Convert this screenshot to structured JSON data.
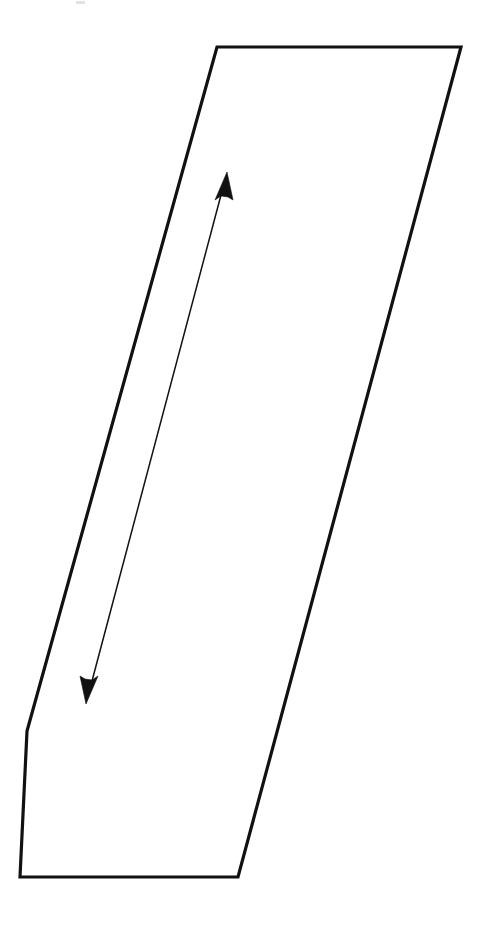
{
  "document": {
    "title": "Parallelogram Outline Diagram",
    "kind": "line-drawing",
    "background_color": "#ffffff",
    "width": 497,
    "height": 925
  },
  "figure": {
    "name": "clipped-parallelogram-with-dimension-arrow",
    "stroke_color": "#111111",
    "fill_color": "#ffffff",
    "outline_stroke_width": 3.2,
    "shape_label": "",
    "polygon": {
      "name": "outline-polygon",
      "closed": true,
      "vertex_count": 5,
      "points": "217,47 461,47 238,877 20,877 27,731",
      "vertices": [
        {
          "id": "top-left",
          "x": 217,
          "y": 47
        },
        {
          "id": "top-right",
          "x": 461,
          "y": 47
        },
        {
          "id": "bottom-right",
          "x": 238,
          "y": 877
        },
        {
          "id": "bottom-left",
          "x": 20,
          "y": 877
        },
        {
          "id": "left-kink",
          "x": 27,
          "y": 731
        }
      ],
      "edges": [
        {
          "id": "top-edge",
          "from": "top-left",
          "to": "top-right",
          "orientation": "horizontal"
        },
        {
          "id": "right-edge",
          "from": "top-right",
          "to": "bottom-right",
          "orientation": "oblique"
        },
        {
          "id": "bottom-edge",
          "from": "bottom-right",
          "to": "bottom-left",
          "orientation": "horizontal"
        },
        {
          "id": "lower-left-edge",
          "from": "bottom-left",
          "to": "left-kink",
          "orientation": "near-vertical"
        },
        {
          "id": "upper-left-edge",
          "from": "left-kink",
          "to": "top-left",
          "orientation": "oblique"
        }
      ]
    },
    "dimension_arrow": {
      "name": "double-headed-dimension-arrow",
      "style": "double-headed",
      "stroke_color": "#111111",
      "stroke_width": 1.5,
      "label": "",
      "start": {
        "id": "arrow-tail-tip",
        "x": 86,
        "y": 704
      },
      "end": {
        "id": "arrow-head-tip",
        "x": 227,
        "y": 172
      },
      "line_start": {
        "x": 92,
        "y": 681
      },
      "line_end": {
        "x": 221,
        "y": 195
      },
      "head_up_polygon": "227,172 215,200 221,196 228,197 233,200",
      "head_down_polygon": "86,704 98,676 92,680 85,679 80,676"
    },
    "artifacts": [
      {
        "id": "scan-speck-top",
        "x": 76,
        "y": 1,
        "width": 9,
        "height": 3,
        "color": "#e2e2e2"
      },
      {
        "id": "scan-speck-mid-left",
        "x": 113,
        "y": 455,
        "width": 2,
        "height": 2,
        "color": "#ededed"
      },
      {
        "id": "scan-speck-mid-low",
        "x": 110,
        "y": 745,
        "width": 2,
        "height": 2,
        "color": "#ededed"
      }
    ]
  }
}
